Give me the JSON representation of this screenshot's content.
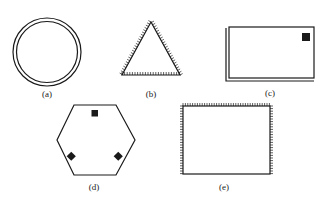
{
  "figure": {
    "panels": [
      {
        "id": "a",
        "label": "(a)",
        "shape": "double-circle",
        "description": "Two concentric circles"
      },
      {
        "id": "b",
        "label": "(b)",
        "shape": "hatched-triangle",
        "description": "Triangle with hatch marks on outside of all edges"
      },
      {
        "id": "c",
        "label": "(c)",
        "shape": "double-rectangle",
        "description": "Rectangle with doubled left and bottom edges and a filled square in top-right corner"
      },
      {
        "id": "d",
        "label": "(d)",
        "shape": "hexagon-with-markers",
        "description": "Hexagon with three filled square markers"
      },
      {
        "id": "e",
        "label": "(e)",
        "shape": "partially-hatched-rectangle",
        "description": "Rectangle with hatch marks on top, left and right edges"
      }
    ],
    "colors": {
      "ink": "#1a1a1a",
      "background": "#ffffff"
    }
  }
}
